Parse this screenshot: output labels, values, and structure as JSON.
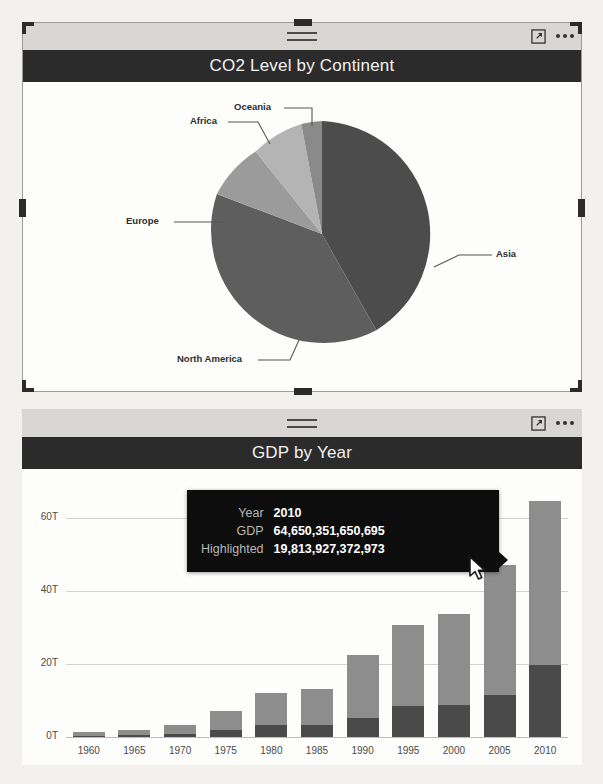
{
  "canvas": {
    "background": "#f3f1ee",
    "width": 603,
    "height": 784
  },
  "visuals": [
    {
      "id": "pie-visual",
      "title": "CO2 Level by Continent",
      "selected": true,
      "header": {
        "drag_handle_icon": "drag-handle-icon",
        "focus_mode_label": "focus-mode-icon",
        "more_options_label": "more-options-icon"
      }
    },
    {
      "id": "bar-visual",
      "title": "GDP by Year",
      "selected": false,
      "header": {
        "drag_handle_icon": "drag-handle-icon",
        "focus_mode_label": "focus-mode-icon",
        "more_options_label": "more-options-icon"
      }
    }
  ],
  "tooltip": {
    "rows": [
      {
        "key": "Year",
        "value": "2010"
      },
      {
        "key": "GDP",
        "value": "64,650,351,650,695"
      },
      {
        "key": "Highlighted",
        "value": "19,813,927,372,973"
      }
    ],
    "background": "#0d0d0d",
    "key_color": "#b8b8b8",
    "value_color": "#ffffff"
  },
  "chart_data": [
    {
      "id": "pie",
      "type": "pie",
      "title": "CO2 Level by Continent",
      "legend": "none",
      "labels_position": "outside-callout",
      "categories": [
        "Asia",
        "North America",
        "Europe",
        "Africa",
        "Oceania"
      ],
      "values": [
        42,
        27,
        21,
        7,
        3
      ],
      "unit": "percent",
      "colors": [
        "#4c4c4c",
        "#5e5e5e",
        "#9a9a9a",
        "#b4b4b4",
        "#8a8a8a"
      ],
      "annotations": [
        "Asia",
        "North America",
        "Europe",
        "Africa",
        "Oceania"
      ]
    },
    {
      "id": "gdp",
      "type": "bar",
      "title": "GDP by Year",
      "stacked": true,
      "xlabel": "",
      "ylabel": "",
      "grid": true,
      "legend_position": "none",
      "categories": [
        "1960",
        "1965",
        "1970",
        "1975",
        "1980",
        "1985",
        "1990",
        "1995",
        "2000",
        "2005",
        "2010"
      ],
      "ytick_labels": [
        "0T",
        "20T",
        "40T",
        "60T"
      ],
      "ytick_values": [
        0,
        20,
        40,
        60
      ],
      "ylim": [
        0,
        70
      ],
      "unit": "trillions USD",
      "series": [
        {
          "name": "GDP",
          "color": "#8d8d8d",
          "values": [
            1.4,
            2.0,
            3.4,
            7.0,
            12.0,
            13.0,
            22.5,
            30.5,
            33.5,
            47.0,
            64.65
          ]
        },
        {
          "name": "Highlighted",
          "color": "#4a4a4a",
          "values": [
            0.3,
            0.5,
            0.9,
            1.9,
            3.2,
            3.4,
            5.2,
            8.5,
            8.8,
            11.5,
            19.81
          ]
        }
      ],
      "hovered_category": "2010"
    }
  ],
  "cursor": {
    "name": "mouse-pointer",
    "x": 470,
    "y": 557
  }
}
